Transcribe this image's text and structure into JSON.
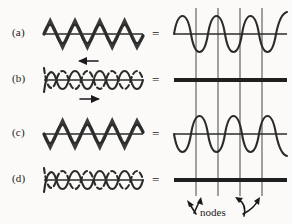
{
  "figure": {
    "rows": [
      {
        "key": "a",
        "label": "(a)",
        "equals": "=",
        "left_description": "two identical waves in phase superimposed",
        "right_description": "resultant wave of double amplitude",
        "waves": [
          "solid",
          "solid-overlap"
        ],
        "arrows": [],
        "result": "wave"
      },
      {
        "key": "b",
        "label": "(b)",
        "equals": "=",
        "left_description": "two waves completely out of phase moving in opposite directions",
        "right_description": "flat line, total destructive interference",
        "waves": [
          "solid",
          "dashed"
        ],
        "arrows": [
          "left",
          "right"
        ],
        "result": "flat"
      },
      {
        "key": "c",
        "label": "(c)",
        "equals": "=",
        "left_description": "two identical waves in phase superimposed",
        "right_description": "resultant wave of double amplitude",
        "waves": [
          "solid",
          "solid-overlap"
        ],
        "arrows": [],
        "result": "wave"
      },
      {
        "key": "d",
        "label": "(d)",
        "equals": "=",
        "left_description": "two waves completely out of phase",
        "right_description": "flat line, total destructive interference",
        "waves": [
          "solid",
          "dashed"
        ],
        "arrows": [],
        "result": "flat"
      }
    ],
    "annotation": {
      "nodes_label": "nodes",
      "node_count": 4,
      "arrow_count": 4
    },
    "colors": {
      "wave_stroke": "#2b2b2b",
      "node_line": "#555555",
      "flat_line": "#1f1f1f",
      "background": "#fbfaf8",
      "text": "#1a1a1a"
    }
  }
}
